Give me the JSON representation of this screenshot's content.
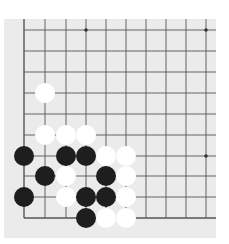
{
  "board": {
    "description": "Go board corner fragment (lower-left corner visible)",
    "background_color": "#ebebeb",
    "line_color": "#555555",
    "columns_x": [
      24,
      45,
      66,
      86,
      106,
      126,
      146,
      166,
      186,
      206
    ],
    "rows_y": [
      30,
      51,
      72,
      93,
      114,
      135,
      156,
      176,
      197,
      218
    ],
    "left_edge_is_border": true,
    "bottom_edge_is_border": true,
    "star_points": [
      {
        "col": 3,
        "row": 0
      },
      {
        "col": 9,
        "row": 0
      },
      {
        "col": 9,
        "row": 6
      }
    ],
    "stone_radius": 10
  },
  "stones": [
    {
      "color": "white",
      "col": 1,
      "row": 3
    },
    {
      "color": "white",
      "col": 1,
      "row": 5
    },
    {
      "color": "white",
      "col": 2,
      "row": 5
    },
    {
      "color": "white",
      "col": 3,
      "row": 5
    },
    {
      "color": "black",
      "col": 0,
      "row": 6
    },
    {
      "color": "black",
      "col": 2,
      "row": 6
    },
    {
      "color": "black",
      "col": 3,
      "row": 6
    },
    {
      "color": "white",
      "col": 4,
      "row": 6
    },
    {
      "color": "white",
      "col": 5,
      "row": 6
    },
    {
      "color": "black",
      "col": 1,
      "row": 7
    },
    {
      "color": "white",
      "col": 2,
      "row": 7
    },
    {
      "color": "black",
      "col": 4,
      "row": 7
    },
    {
      "color": "white",
      "col": 5,
      "row": 7
    },
    {
      "color": "black",
      "col": 0,
      "row": 8
    },
    {
      "color": "white",
      "col": 2,
      "row": 8
    },
    {
      "color": "black",
      "col": 3,
      "row": 8
    },
    {
      "color": "black",
      "col": 4,
      "row": 8
    },
    {
      "color": "white",
      "col": 5,
      "row": 8
    },
    {
      "color": "black",
      "col": 3,
      "row": 9
    },
    {
      "color": "white",
      "col": 4,
      "row": 9
    },
    {
      "color": "white",
      "col": 5,
      "row": 9
    }
  ],
  "colors": {
    "black_stone": "#1e1e1e",
    "white_stone": "#ffffff"
  }
}
